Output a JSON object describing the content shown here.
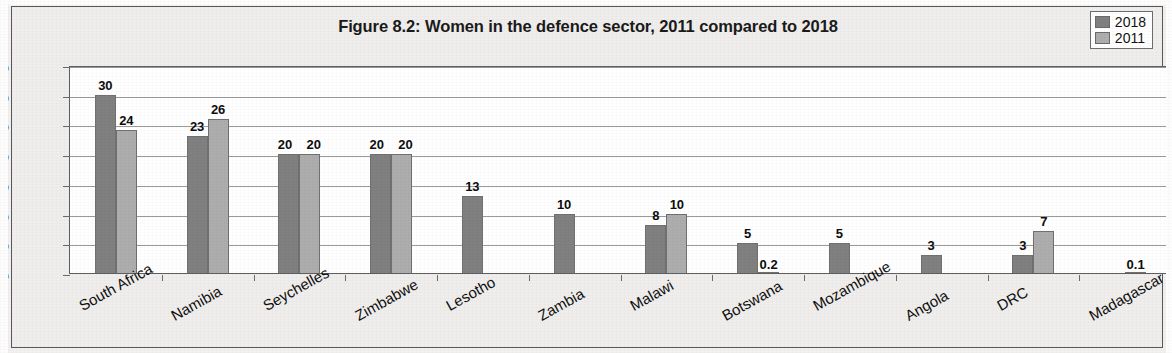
{
  "figure": {
    "title": "Figure 8.2: Women in the defence sector, 2011 compared to 2018"
  },
  "legend": {
    "position": "top-right",
    "entries": [
      {
        "label": "2018",
        "color": "#808080"
      },
      {
        "label": "2011",
        "color": "#adadad"
      }
    ]
  },
  "axis": {
    "y_ticks": [
      "0%",
      "5%",
      "10%",
      "15%",
      "20%",
      "25%",
      "30%",
      "35%"
    ]
  },
  "chart_data": {
    "type": "bar",
    "title": "Figure 8.2: Women in the defence sector, 2011 compared to 2018",
    "xlabel": "",
    "ylabel": "",
    "ylim": [
      0,
      35
    ],
    "ytick_step": 5,
    "ytick_format": "percent",
    "grid": true,
    "legend_position": "top-right",
    "categories": [
      "South Africa",
      "Namibia",
      "Seychelles",
      "Zimbabwe",
      "Lesotho",
      "Zambia",
      "Malawi",
      "Botswana",
      "Mozambique",
      "Angola",
      "DRC",
      "Madagascar"
    ],
    "series": [
      {
        "name": "2018",
        "color": "#808080",
        "values": [
          30,
          23,
          20,
          20,
          13,
          10,
          8,
          5,
          5,
          3,
          3,
          null
        ],
        "labels": [
          "30",
          "23",
          "20",
          "20",
          "13",
          "10",
          "8",
          "5",
          "5",
          "3",
          "3",
          ""
        ]
      },
      {
        "name": "2011",
        "color": "#adadad",
        "values": [
          24,
          26,
          20,
          20,
          null,
          null,
          10,
          0.2,
          null,
          null,
          7,
          0.1
        ],
        "labels": [
          "24",
          "26",
          "20",
          "20",
          "",
          "",
          "10",
          "0.2",
          "",
          "",
          "7",
          "0.1"
        ]
      }
    ]
  }
}
